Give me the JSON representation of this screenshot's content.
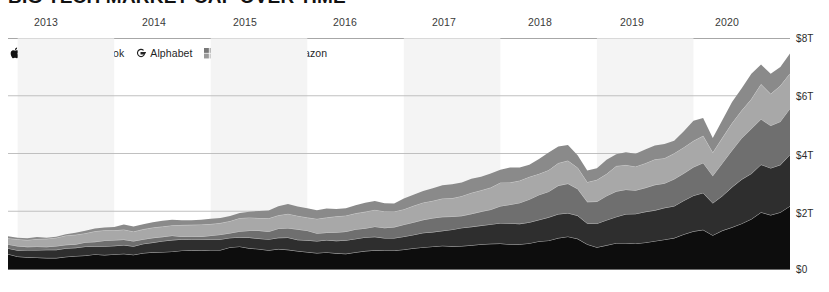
{
  "title": "BIG TECH MARKET CAP OVER TIME",
  "legend": {
    "items": [
      {
        "label": "Apple",
        "icon": "apple-logo-icon",
        "color": "#0d0d0d"
      },
      {
        "label": "Facebook",
        "icon": "facebook-f-icon",
        "color": "#2e2e2e"
      },
      {
        "label": "Alphabet",
        "icon": "google-g-icon",
        "color": "#6f6f6f"
      },
      {
        "label": "Microsoft",
        "icon": "microsoft-grid-icon",
        "color": "#a8a8a8"
      },
      {
        "label": "Amazon",
        "icon": "amazon-a-icon",
        "color": "#8a8a8a"
      }
    ]
  },
  "axes": {
    "x_ticks": [
      {
        "label": "2013",
        "x": 34
      },
      {
        "label": "2014",
        "x": 142
      },
      {
        "label": "2015",
        "x": 233
      },
      {
        "label": "2016",
        "x": 333
      },
      {
        "label": "2017",
        "x": 432
      },
      {
        "label": "2018",
        "x": 528
      },
      {
        "label": "2019",
        "x": 620
      },
      {
        "label": "2020",
        "x": 715
      }
    ],
    "y_ticks": [
      {
        "label": "$8T",
        "y": 38
      },
      {
        "label": "$6T",
        "y": 96
      },
      {
        "label": "$4T",
        "y": 155
      },
      {
        "label": "$2T",
        "y": 213
      },
      {
        "label": "$0",
        "y": 269
      }
    ]
  },
  "chart_data": {
    "type": "area",
    "stacked": true,
    "title": "BIG TECH MARKET CAP OVER TIME",
    "xlabel": "",
    "ylabel": "",
    "ylim": [
      0,
      8
    ],
    "y_unit": "trillion USD",
    "grid": true,
    "legend_position": "top-left",
    "x": [
      2012.9,
      2013.0,
      2013.1,
      2013.2,
      2013.3,
      2013.4,
      2013.5,
      2013.6,
      2013.7,
      2013.8,
      2013.9,
      2014.0,
      2014.1,
      2014.2,
      2014.3,
      2014.4,
      2014.5,
      2014.6,
      2014.7,
      2014.8,
      2014.9,
      2015.0,
      2015.1,
      2015.2,
      2015.3,
      2015.4,
      2015.5,
      2015.6,
      2015.7,
      2015.8,
      2015.9,
      2016.0,
      2016.1,
      2016.2,
      2016.3,
      2016.4,
      2016.5,
      2016.6,
      2016.7,
      2016.8,
      2016.9,
      2017.0,
      2017.1,
      2017.2,
      2017.3,
      2017.4,
      2017.5,
      2017.6,
      2017.7,
      2017.8,
      2017.9,
      2018.0,
      2018.1,
      2018.2,
      2018.3,
      2018.4,
      2018.5,
      2018.6,
      2018.7,
      2018.8,
      2018.9,
      2019.0,
      2019.1,
      2019.2,
      2019.3,
      2019.4,
      2019.5,
      2019.6,
      2019.7,
      2019.8,
      2019.9,
      2020.0,
      2020.1,
      2020.2,
      2020.3,
      2020.4,
      2020.5,
      2020.6,
      2020.7,
      2020.8,
      2020.9,
      2021.0
    ],
    "series": [
      {
        "name": "Apple",
        "color": "#0d0d0d",
        "values": [
          0.5,
          0.42,
          0.4,
          0.39,
          0.38,
          0.37,
          0.41,
          0.44,
          0.46,
          0.48,
          0.47,
          0.48,
          0.5,
          0.47,
          0.52,
          0.56,
          0.58,
          0.6,
          0.62,
          0.64,
          0.63,
          0.64,
          0.66,
          0.72,
          0.74,
          0.7,
          0.66,
          0.63,
          0.66,
          0.65,
          0.6,
          0.58,
          0.55,
          0.57,
          0.54,
          0.53,
          0.57,
          0.61,
          0.63,
          0.62,
          0.61,
          0.64,
          0.69,
          0.73,
          0.75,
          0.77,
          0.78,
          0.8,
          0.82,
          0.84,
          0.86,
          0.88,
          0.85,
          0.83,
          0.87,
          0.92,
          0.96,
          1.05,
          1.09,
          1.02,
          0.83,
          0.75,
          0.81,
          0.88,
          0.9,
          0.87,
          0.92,
          0.95,
          0.99,
          1.05,
          1.17,
          1.28,
          1.33,
          1.15,
          1.3,
          1.45,
          1.58,
          1.72,
          1.95,
          1.88,
          1.98,
          2.18
        ]
      },
      {
        "name": "Microsoft",
        "color": "#2e2e2e",
        "values": [
          0.22,
          0.23,
          0.23,
          0.24,
          0.25,
          0.27,
          0.28,
          0.27,
          0.29,
          0.3,
          0.31,
          0.31,
          0.32,
          0.32,
          0.34,
          0.35,
          0.37,
          0.38,
          0.37,
          0.35,
          0.36,
          0.36,
          0.35,
          0.34,
          0.36,
          0.38,
          0.39,
          0.4,
          0.42,
          0.43,
          0.42,
          0.41,
          0.4,
          0.41,
          0.42,
          0.43,
          0.44,
          0.45,
          0.46,
          0.45,
          0.46,
          0.48,
          0.5,
          0.52,
          0.53,
          0.54,
          0.56,
          0.58,
          0.61,
          0.63,
          0.65,
          0.68,
          0.7,
          0.72,
          0.75,
          0.78,
          0.82,
          0.85,
          0.86,
          0.82,
          0.74,
          0.78,
          0.85,
          0.9,
          0.96,
          1.0,
          1.03,
          1.06,
          1.09,
          1.12,
          1.2,
          1.26,
          1.3,
          1.12,
          1.25,
          1.38,
          1.48,
          1.56,
          1.62,
          1.55,
          1.6,
          1.72
        ]
      },
      {
        "name": "Amazon",
        "color": "#6f6f6f",
        "values": [
          0.11,
          0.12,
          0.12,
          0.13,
          0.13,
          0.14,
          0.14,
          0.15,
          0.16,
          0.17,
          0.18,
          0.18,
          0.17,
          0.16,
          0.15,
          0.15,
          0.14,
          0.15,
          0.14,
          0.14,
          0.14,
          0.15,
          0.17,
          0.19,
          0.21,
          0.23,
          0.24,
          0.25,
          0.28,
          0.31,
          0.32,
          0.3,
          0.28,
          0.29,
          0.31,
          0.33,
          0.35,
          0.36,
          0.37,
          0.36,
          0.36,
          0.38,
          0.41,
          0.44,
          0.46,
          0.47,
          0.45,
          0.47,
          0.49,
          0.52,
          0.56,
          0.62,
          0.68,
          0.74,
          0.78,
          0.82,
          0.88,
          0.95,
          0.97,
          0.88,
          0.73,
          0.79,
          0.86,
          0.9,
          0.88,
          0.85,
          0.88,
          0.9,
          0.88,
          0.89,
          0.93,
          0.96,
          1.0,
          0.9,
          1.05,
          1.24,
          1.42,
          1.58,
          1.65,
          1.56,
          1.58,
          1.68
        ]
      },
      {
        "name": "Alphabet",
        "color": "#a8a8a8",
        "values": [
          0.24,
          0.25,
          0.25,
          0.26,
          0.27,
          0.28,
          0.29,
          0.3,
          0.31,
          0.33,
          0.35,
          0.36,
          0.37,
          0.36,
          0.37,
          0.38,
          0.39,
          0.38,
          0.37,
          0.36,
          0.37,
          0.38,
          0.37,
          0.38,
          0.41,
          0.44,
          0.46,
          0.48,
          0.5,
          0.52,
          0.51,
          0.5,
          0.49,
          0.5,
          0.51,
          0.52,
          0.53,
          0.54,
          0.55,
          0.54,
          0.55,
          0.57,
          0.59,
          0.62,
          0.64,
          0.65,
          0.66,
          0.67,
          0.69,
          0.71,
          0.73,
          0.76,
          0.75,
          0.74,
          0.76,
          0.78,
          0.8,
          0.82,
          0.83,
          0.78,
          0.72,
          0.76,
          0.81,
          0.84,
          0.8,
          0.78,
          0.8,
          0.82,
          0.85,
          0.88,
          0.92,
          0.98,
          1.0,
          0.86,
          0.95,
          1.02,
          1.06,
          1.08,
          1.12,
          1.05,
          1.1,
          1.18
        ]
      },
      {
        "name": "Facebook",
        "color": "#8a8a8a",
        "values": [
          0.06,
          0.06,
          0.06,
          0.07,
          0.07,
          0.08,
          0.09,
          0.1,
          0.11,
          0.12,
          0.13,
          0.14,
          0.15,
          0.15,
          0.16,
          0.16,
          0.17,
          0.18,
          0.19,
          0.2,
          0.21,
          0.22,
          0.22,
          0.22,
          0.23,
          0.24,
          0.25,
          0.26,
          0.28,
          0.3,
          0.29,
          0.28,
          0.29,
          0.3,
          0.31,
          0.32,
          0.33,
          0.34,
          0.35,
          0.34,
          0.33,
          0.34,
          0.36,
          0.39,
          0.41,
          0.43,
          0.45,
          0.47,
          0.49,
          0.5,
          0.52,
          0.53,
          0.55,
          0.52,
          0.48,
          0.54,
          0.56,
          0.53,
          0.5,
          0.44,
          0.38,
          0.4,
          0.45,
          0.5,
          0.52,
          0.5,
          0.53,
          0.55,
          0.52,
          0.54,
          0.58,
          0.59,
          0.6,
          0.5,
          0.58,
          0.65,
          0.7,
          0.74,
          0.76,
          0.72,
          0.75,
          0.78
        ]
      }
    ]
  }
}
